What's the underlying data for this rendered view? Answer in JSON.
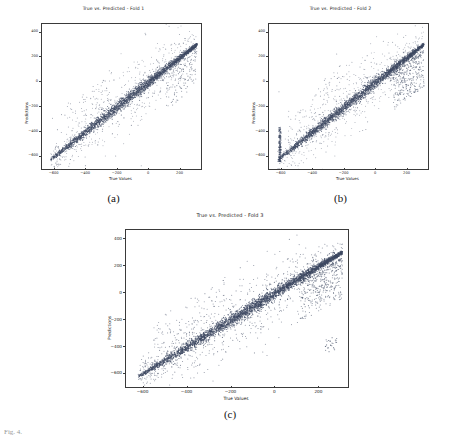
{
  "figure": {
    "caption_partial": "Fig. 4.",
    "subcaptions": [
      "(a)",
      "(b)",
      "(c)"
    ]
  },
  "chart_data": [
    {
      "type": "scatter",
      "title": "True vs. Predicted - Fold 1",
      "xlabel": "True Values",
      "ylabel": "Predictions",
      "xlim": [
        -680,
        330
      ],
      "ylim": [
        -700,
        470
      ],
      "xticks": [
        -600,
        -400,
        -200,
        0,
        200
      ],
      "yticks": [
        400,
        200,
        0,
        -200,
        -400,
        -600
      ],
      "grid": false,
      "legend": null,
      "point_color": "#3f4a63",
      "n_points": 2600,
      "trend": "identity",
      "description": "Dense near-linear band along y = x from (-620,-640) to (300,340); scatter spread widens in the mid range with sparse outliers above and below the band."
    },
    {
      "type": "scatter",
      "title": "True vs. Predicted - Fold 2",
      "xlabel": "True Values",
      "ylabel": "Predictions",
      "xlim": [
        -680,
        330
      ],
      "ylim": [
        -700,
        470
      ],
      "xticks": [
        -600,
        -400,
        -200,
        0,
        200
      ],
      "yticks": [
        400,
        200,
        0,
        -200,
        -400,
        -600
      ],
      "grid": false,
      "legend": null,
      "point_color": "#3f4a63",
      "n_points": 2600,
      "trend": "identity",
      "description": "Dense near-linear band along y = x; a vertical streak of points at the far left edge near x = -610, and a wide fan of outliers near x = 150 to 300."
    },
    {
      "type": "scatter",
      "title": "True vs. Predicted - Fold 3",
      "xlabel": "True Values",
      "ylabel": "Predictions",
      "xlim": [
        -680,
        330
      ],
      "ylim": [
        -700,
        470
      ],
      "xticks": [
        -600,
        -400,
        -200,
        0,
        200
      ],
      "yticks": [
        400,
        200,
        0,
        -200,
        -400,
        -600
      ],
      "grid": false,
      "legend": null,
      "point_color": "#3f4a63",
      "n_points": 3400,
      "trend": "identity",
      "description": "Dense near-linear band along y = x from (-620,-620) to (300,320); scatter fans out between x = 150 and x = 300 with isolated low outliers near (250,-400)."
    }
  ]
}
